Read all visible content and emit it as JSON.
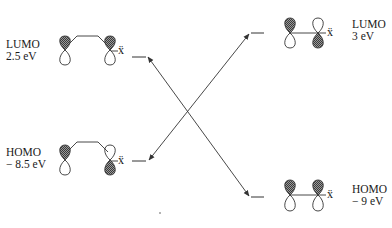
{
  "diagram": {
    "type": "frontier-molecular-orbital-interaction",
    "left_molecule": {
      "lumo": {
        "label": "LUMO",
        "energy": "2.5 eV",
        "substituent": "ẍ",
        "lobes": {
          "atom1_top": "shaded",
          "atom2_top": "shaded"
        }
      },
      "homo": {
        "label": "HOMO",
        "energy": "− 8.5 eV",
        "substituent": "ẍ",
        "lobes": {
          "atom1_top": "shaded",
          "atom2_top": "white"
        }
      }
    },
    "right_molecule": {
      "lumo": {
        "label": "LUMO",
        "energy": "3 eV",
        "substituent": "ẍ",
        "lobes": {
          "atom1_top": "shaded",
          "atom2_top": "white"
        }
      },
      "homo": {
        "label": "HOMO",
        "energy": "− 9 eV",
        "substituent": "ẍ",
        "lobes": {
          "atom1_top": "shaded",
          "atom2_top": "shaded"
        }
      }
    },
    "interactions": [
      {
        "from": "left.lumo",
        "to": "right.homo",
        "style": "double-arrow"
      },
      {
        "from": "left.homo",
        "to": "right.lumo",
        "style": "double-arrow"
      }
    ],
    "colors": {
      "line": "#333333",
      "shade": "#6a6a6a"
    }
  }
}
